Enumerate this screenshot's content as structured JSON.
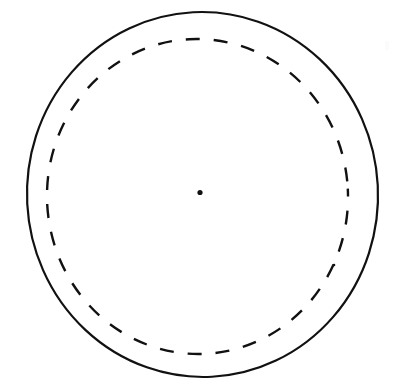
{
  "figure": {
    "title": "Concentric circles with center point",
    "background_color": "#ffffff",
    "stroke_color": "#111111",
    "width": 393,
    "height": 389
  },
  "chart_data": {
    "type": "scatter",
    "title": "",
    "xlabel": "",
    "ylabel": "",
    "grid": false,
    "legend": "none",
    "xlim": [
      0,
      393
    ],
    "ylim": [
      0,
      389
    ],
    "shapes": [
      {
        "name": "outer-circle",
        "kind": "ellipse",
        "style": "solid",
        "cx": 202.5,
        "cy": 194.5,
        "rx": 175.5,
        "ry": 182.5,
        "rotation": -3,
        "stroke": "#111111",
        "stroke_width": 2.2,
        "fill": "none"
      },
      {
        "name": "inner-dashed-circle",
        "kind": "ellipse",
        "style": "dashed",
        "cx": 197.5,
        "cy": 196.5,
        "rx": 150.5,
        "ry": 157.5,
        "rotation": -3,
        "stroke": "#111111",
        "stroke_width": 2.4,
        "fill": "none",
        "dash_length": 14,
        "dash_gap": 14
      },
      {
        "name": "center-point",
        "kind": "point",
        "cx": 200,
        "cy": 192.5,
        "r": 2.6,
        "fill": "#111111"
      }
    ],
    "points": [
      {
        "label": "center",
        "x": 200,
        "y": 192.5
      }
    ],
    "annotations": []
  }
}
